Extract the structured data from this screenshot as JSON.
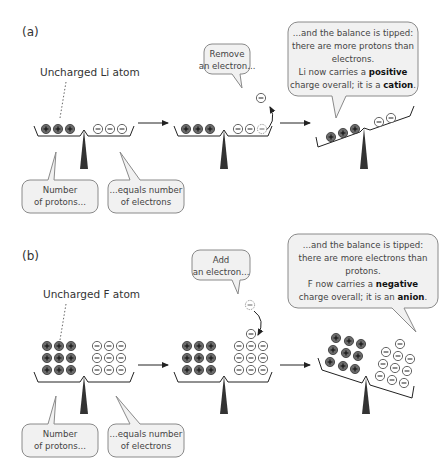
{
  "panels": [
    {
      "id": "a",
      "label": "(a)",
      "atom_label": "Uncharged Li atom",
      "protons": 3,
      "electrons_initial": 3,
      "step_bubble": [
        "Remove",
        "an electron..."
      ],
      "bubble_left": [
        "Number",
        "of protons..."
      ],
      "bubble_right": [
        "...equals number",
        "of electrons"
      ],
      "result_bubble": {
        "line1": "...and the balance is tipped:",
        "line2": "there are more protons than",
        "line3": "electrons.",
        "line4_pre": "Li now carries a ",
        "line4_bold": "positive",
        "line5_pre": "charge overall; it is a ",
        "line5_bold": "cation",
        "line5_post": "."
      }
    },
    {
      "id": "b",
      "label": "(b)",
      "atom_label": "Uncharged F atom",
      "protons": 9,
      "electrons_initial": 9,
      "step_bubble": [
        "Add",
        "an electron..."
      ],
      "bubble_left": [
        "Number",
        "of protons..."
      ],
      "bubble_right": [
        "...equals number",
        "of electrons"
      ],
      "result_bubble": {
        "line1": "...and the balance is tipped:",
        "line2": "there are more electrons than",
        "line3": "protons.",
        "line4_pre": "F now carries a ",
        "line4_bold": "negative",
        "line5_pre": "charge overall; it is an ",
        "line5_bold": "anion",
        "line5_post": "."
      }
    }
  ],
  "symbols": {
    "proton": "+",
    "electron": "−"
  },
  "colors": {
    "proton_fill": "#6b6b6b",
    "electron_stroke": "#555555",
    "fulcrum": "#333333",
    "bubble_fill": "#f1f1f1",
    "bubble_stroke": "#8a8a8a"
  }
}
